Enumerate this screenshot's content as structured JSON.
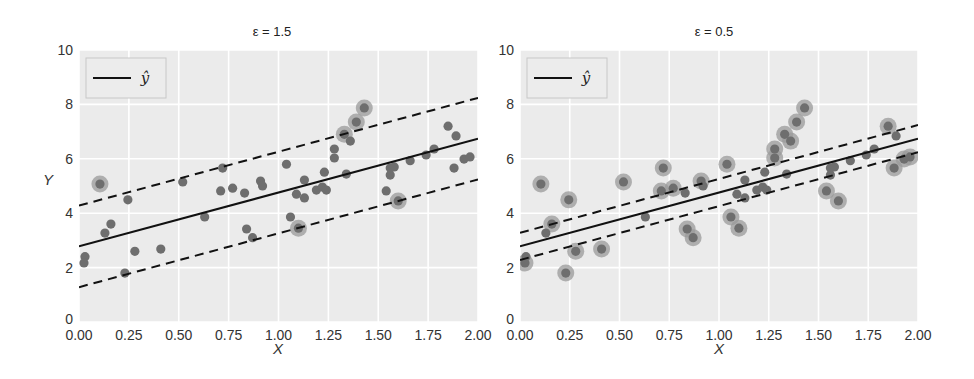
{
  "chart_data": [
    {
      "type": "scatter",
      "title": "ε = 1.5",
      "epsilon": 1.5,
      "xlabel": "X",
      "ylabel": "Y",
      "xlim": [
        0,
        2.0
      ],
      "ylim": [
        0,
        10
      ],
      "xticks": [
        "0.00",
        "0.25",
        "0.50",
        "0.75",
        "1.00",
        "1.25",
        "1.50",
        "1.75",
        "2.00"
      ],
      "yticks": [
        "0",
        "2",
        "4",
        "6",
        "8",
        "10"
      ],
      "grid": true,
      "legend": {
        "position": "upper left",
        "entries": [
          "ŷ"
        ]
      },
      "regression_line": {
        "intercept": 2.78,
        "slope": 1.98,
        "style": "solid"
      },
      "margin_lines": {
        "offset": 1.5,
        "style": "dashed"
      },
      "support_vectors_highlighted": true
    },
    {
      "type": "scatter",
      "title": "ε = 0.5",
      "epsilon": 0.5,
      "xlabel": "X",
      "ylabel": "",
      "xlim": [
        0,
        2.0
      ],
      "ylim": [
        0,
        10
      ],
      "xticks": [
        "0.00",
        "0.25",
        "0.50",
        "0.75",
        "1.00",
        "1.25",
        "1.50",
        "1.75",
        "2.00"
      ],
      "yticks": [
        "0",
        "2",
        "4",
        "6",
        "8",
        "10"
      ],
      "grid": true,
      "legend": {
        "position": "upper left",
        "entries": [
          "ŷ"
        ]
      },
      "regression_line": {
        "intercept": 2.78,
        "slope": 1.98,
        "style": "solid"
      },
      "margin_lines": {
        "offset": 0.5,
        "style": "dashed"
      },
      "support_vectors_highlighted": true
    }
  ],
  "points": {
    "x": [
      0.03,
      0.025,
      0.105,
      0.13,
      0.16,
      0.23,
      0.245,
      0.28,
      0.41,
      0.52,
      0.63,
      0.71,
      0.72,
      0.77,
      0.83,
      0.84,
      0.87,
      0.91,
      0.92,
      1.04,
      1.06,
      1.09,
      1.1,
      1.13,
      1.13,
      1.19,
      1.22,
      1.23,
      1.24,
      1.28,
      1.28,
      1.33,
      1.34,
      1.36,
      1.39,
      1.43,
      1.54,
      1.56,
      1.56,
      1.58,
      1.6,
      1.66,
      1.74,
      1.78,
      1.85,
      1.88,
      1.89,
      1.93,
      1.96
    ],
    "y": [
      2.4,
      2.17,
      5.07,
      3.27,
      3.6,
      1.8,
      4.49,
      2.6,
      2.68,
      5.15,
      3.86,
      4.82,
      5.66,
      4.92,
      4.74,
      3.42,
      3.1,
      5.18,
      5.0,
      5.8,
      3.86,
      4.7,
      3.45,
      5.22,
      4.56,
      4.85,
      4.96,
      5.51,
      4.85,
      6.36,
      6.03,
      6.9,
      5.44,
      6.65,
      7.35,
      7.87,
      4.82,
      5.66,
      5.4,
      5.7,
      4.45,
      5.93,
      6.14,
      6.36,
      7.2,
      5.66,
      6.84,
      5.99,
      6.07
    ]
  },
  "colors": {
    "plot_bg": "#ebebeb",
    "grid": "#ffffff",
    "point": "#6e6e6e",
    "halo": "#9a9a9a",
    "line": "#111111",
    "legend_border": "#c8c8c8",
    "legend_bg": "#ececec"
  },
  "layout": {
    "panels": [
      {
        "left": 79,
        "right": 478,
        "top": 50,
        "bottom": 322,
        "title_x": 272,
        "title_y": 36,
        "ylabel_x": 48,
        "ylabel_y": 185,
        "xlabel_x": 278,
        "xlabel_y": 354
      },
      {
        "left": 520,
        "right": 918,
        "top": 50,
        "bottom": 322,
        "title_x": 714,
        "title_y": 36,
        "ylabel_x": null,
        "ylabel_y": null,
        "xlabel_x": 719,
        "xlabel_y": 354
      }
    ]
  }
}
